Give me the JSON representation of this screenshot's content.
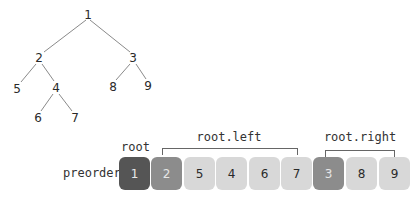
{
  "tree": {
    "nodes": [
      {
        "id": "1",
        "x": 88,
        "y": 15
      },
      {
        "id": "2",
        "x": 39,
        "y": 58
      },
      {
        "id": "3",
        "x": 133,
        "y": 58
      },
      {
        "id": "5",
        "x": 17,
        "y": 89
      },
      {
        "id": "4",
        "x": 56,
        "y": 88
      },
      {
        "id": "8",
        "x": 113,
        "y": 87
      },
      {
        "id": "9",
        "x": 148,
        "y": 86
      },
      {
        "id": "6",
        "x": 38,
        "y": 118
      },
      {
        "id": "7",
        "x": 75,
        "y": 118
      }
    ],
    "edges": [
      [
        "1",
        "2"
      ],
      [
        "1",
        "3"
      ],
      [
        "2",
        "5"
      ],
      [
        "2",
        "4"
      ],
      [
        "4",
        "6"
      ],
      [
        "4",
        "7"
      ],
      [
        "3",
        "8"
      ],
      [
        "3",
        "9"
      ]
    ]
  },
  "array": {
    "row_label": "preorder",
    "cells": [
      {
        "value": "1",
        "role": "root"
      },
      {
        "value": "2",
        "role": "subroot"
      },
      {
        "value": "5",
        "role": "plain"
      },
      {
        "value": "4",
        "role": "plain"
      },
      {
        "value": "6",
        "role": "plain"
      },
      {
        "value": "7",
        "role": "plain"
      },
      {
        "value": "3",
        "role": "subroot"
      },
      {
        "value": "8",
        "role": "plain"
      },
      {
        "value": "9",
        "role": "plain"
      }
    ]
  },
  "annotations": {
    "root_label": "root",
    "left_label": "root.left",
    "right_label": "root.right"
  },
  "colors": {
    "root": "#555555",
    "subroot": "#8c8c8c",
    "plain": "#d8d8d8",
    "edge": "#888888"
  }
}
